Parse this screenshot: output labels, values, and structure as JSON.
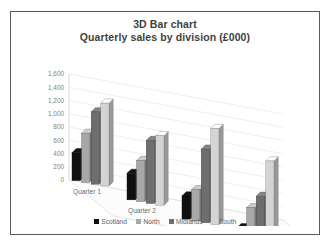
{
  "chart_data": {
    "type": "bar",
    "title": "3D Bar chart",
    "subtitle": "Quarterly sales by division (£000)",
    "xlabel": "",
    "ylabel": "",
    "ylim": [
      0,
      1600
    ],
    "ytick_step": 200,
    "ytick_labels": [
      "1,600",
      "1,400",
      "1,200",
      "1,000",
      "800",
      "600",
      "400",
      "200",
      "0"
    ],
    "grid": true,
    "legend_position": "bottom",
    "three_d": true,
    "categories": [
      "Quarter 1",
      "Quarter 2",
      "Quarter 3",
      "Quarter 4"
    ],
    "series": [
      {
        "name": "Scotland",
        "color": "#101010",
        "values": [
          420,
          400,
          350,
          160
        ]
      },
      {
        "name": "North",
        "color": "#a8a8a8",
        "values": [
          740,
          620,
          470,
          490
        ]
      },
      {
        "name": "Midlands",
        "color": "#6e6e6e",
        "values": [
          1090,
          950,
          1110,
          690
        ]
      },
      {
        "name": "South",
        "color": "#d4d4d4",
        "values": [
          1250,
          1050,
          1450,
          1250
        ]
      }
    ]
  },
  "legend": {
    "items": [
      {
        "label": "Scotland",
        "color": "#101010"
      },
      {
        "label": "North",
        "color": "#a8a8a8"
      },
      {
        "label": "Midlands",
        "color": "#6e6e6e"
      },
      {
        "label": "South",
        "color": "#d4d4d4"
      }
    ]
  }
}
